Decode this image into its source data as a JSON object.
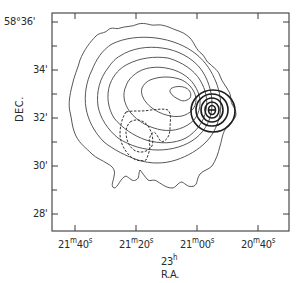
{
  "figure": {
    "type": "radio contour map",
    "y_axis": {
      "label": "DEC.",
      "ticks": [
        {
          "text": "58°36'",
          "y": 22
        },
        {
          "text": "34'",
          "y": 70
        },
        {
          "text": "32'",
          "y": 118
        },
        {
          "text": "30'",
          "y": 166
        },
        {
          "text": "28'",
          "y": 214
        }
      ],
      "minor_tick_ys": [
        46,
        94,
        142,
        190
      ]
    },
    "x_axis": {
      "label_line1_base": "23",
      "label_line1_sup": "h",
      "label_line2": "R.A.",
      "ticks": [
        {
          "main": "21",
          "sup1": "m",
          "sec": "40",
          "sup2": "s",
          "x": 75
        },
        {
          "main": "21",
          "sup1": "m",
          "sec": "20",
          "sup2": "s",
          "x": 136
        },
        {
          "main": "21",
          "sup1": "m",
          "sec": "00",
          "sup2": "s",
          "x": 197
        },
        {
          "main": "20",
          "sup1": "m",
          "sec": "40",
          "sup2": "s",
          "x": 258
        }
      ]
    },
    "legend": {
      "thin_solid": "extended emission contours",
      "dashed": "secondary component contours",
      "thick_solid": "compact source contours (centered near 21m02s, 32.4')"
    },
    "colors": {
      "ink": "#2a2a2a",
      "background": "#ffffff"
    }
  }
}
